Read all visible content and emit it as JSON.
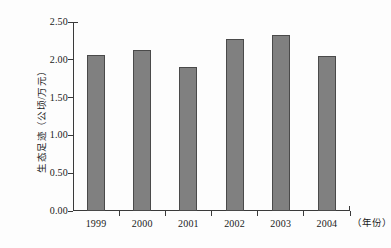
{
  "chart_data": {
    "type": "bar",
    "title": "",
    "categories": [
      "1999",
      "2000",
      "2001",
      "2002",
      "2003",
      "2004"
    ],
    "values": [
      2.07,
      2.13,
      1.91,
      2.27,
      2.33,
      2.05
    ],
    "series": [
      {
        "name": "生态足迹",
        "values": [
          2.07,
          2.13,
          1.91,
          2.27,
          2.33,
          2.05
        ]
      }
    ],
    "xlabel": "（年份）",
    "ylabel": "生态足迹（公顷/万元）",
    "ylim": [
      0.0,
      2.5
    ],
    "ytick_values": [
      0.0,
      0.5,
      1.0,
      1.5,
      2.0,
      2.5
    ],
    "ytick_labels": [
      "0.00",
      "0.50",
      "1.00",
      "1.50",
      "2.00",
      "2.50"
    ],
    "grid": false,
    "legend": "none",
    "bar_color": "#808080",
    "bar_edge_color": "#4a4a4a",
    "axis_color": "#3a3a3a",
    "background_color": "#fdfdfd"
  }
}
